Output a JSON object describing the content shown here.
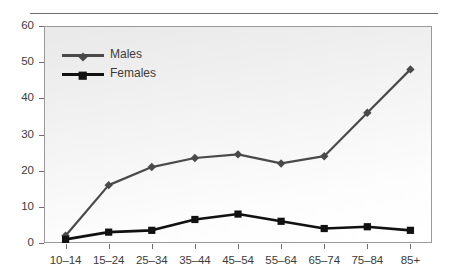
{
  "chart_data": {
    "type": "line",
    "title": "",
    "subtitle": "",
    "xlabel": "",
    "ylabel": "",
    "categories": [
      "10–14",
      "15–24",
      "25–34",
      "35–44",
      "45–54",
      "55–64",
      "65–74",
      "75–84",
      "85+"
    ],
    "ylim": [
      0,
      60
    ],
    "yticks": [
      0,
      10,
      20,
      30,
      40,
      50,
      60
    ],
    "ytick_labels": [
      "0",
      "10",
      "20",
      "30",
      "40",
      "50",
      "60"
    ],
    "grid": false,
    "legend_position": "top-left",
    "series": [
      {
        "name": "Males",
        "marker": "diamond",
        "color": "#4a4a4a",
        "values": [
          2,
          16,
          21,
          23.5,
          24.5,
          22,
          24,
          36,
          48
        ]
      },
      {
        "name": "Females",
        "marker": "square",
        "color": "#111111",
        "values": [
          1,
          3,
          3.5,
          6.5,
          8,
          6,
          4,
          4.5,
          3.5
        ]
      }
    ]
  },
  "legend": {
    "items": [
      {
        "label": "Males"
      },
      {
        "label": "Females"
      }
    ]
  },
  "colors": {
    "males": "#4a4a4a",
    "females": "#111111",
    "axis": "#6e6e6e",
    "frame": "#9a9a9a",
    "text": "#3b3b3b"
  }
}
